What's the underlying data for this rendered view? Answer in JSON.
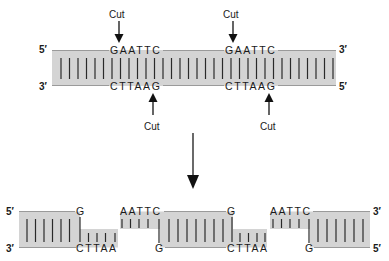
{
  "diagram": {
    "colors": {
      "band_fill": "#d4d4d4",
      "strand_line": "#9a9a9a",
      "bar": "#2a2a2a",
      "text": "#1a1a1a"
    },
    "top_dna": {
      "left_top_end": "5′",
      "left_bottom_end": "3′",
      "right_top_end": "3′",
      "right_bottom_end": "5′",
      "sites": [
        {
          "top_seq": "GAATTC",
          "bottom_seq": "CTTAAG",
          "top_cut_label": "Cut",
          "bottom_cut_label": "Cut"
        },
        {
          "top_seq": "GAATTC",
          "bottom_seq": "CTTAAG",
          "top_cut_label": "Cut",
          "bottom_cut_label": "Cut"
        }
      ]
    },
    "process_arrow": "down-arrow",
    "fragments": [
      {
        "left_top_end": "5′",
        "left_bottom_end": "3′",
        "top_overhang": "G",
        "bottom_overhang": "CTTAA"
      },
      {
        "top_left": "AATTC",
        "bottom_left": "G",
        "top_right": "G",
        "bottom_right": "CTTAA"
      },
      {
        "top_left": "AATTC",
        "bottom_left": "G",
        "right_top_end": "3′",
        "right_bottom_end": "5′"
      }
    ]
  }
}
